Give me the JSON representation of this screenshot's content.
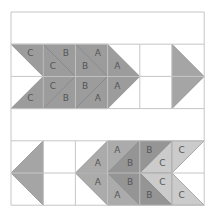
{
  "grid": {
    "x0": 11,
    "y0": 12,
    "cell": 32.2,
    "cols": 6,
    "rows": 6,
    "line_color": "#c6c6c6"
  },
  "colors": {
    "top": "#9c9c9c",
    "A": "#ababab",
    "B": "#959595",
    "C": "#cbcbcb",
    "single": "#a5a5a5"
  },
  "pieces": [
    {
      "id": "top-c1-up",
      "pts": [
        [
          0,
          1
        ],
        [
          1,
          1
        ],
        [
          1,
          2
        ]
      ],
      "fill": "top",
      "label": "C",
      "lx": 0.6,
      "ly": 1.3
    },
    {
      "id": "top-c1-dn",
      "pts": [
        [
          0,
          3
        ],
        [
          1,
          3
        ],
        [
          1,
          2
        ]
      ],
      "fill": "top",
      "label": "C",
      "lx": 0.6,
      "ly": 2.7
    },
    {
      "id": "top-c2-tr",
      "pts": [
        [
          1,
          1
        ],
        [
          2,
          1
        ],
        [
          2,
          2
        ]
      ],
      "fill": "top",
      "label": "B",
      "lx": 1.7,
      "ly": 1.3
    },
    {
      "id": "top-c2-mu",
      "pts": [
        [
          1,
          1
        ],
        [
          2,
          2
        ],
        [
          1,
          2
        ]
      ],
      "fill": "top",
      "label": "C",
      "lx": 1.3,
      "ly": 1.7
    },
    {
      "id": "top-c2-md",
      "pts": [
        [
          1,
          2
        ],
        [
          2,
          2
        ],
        [
          1,
          3
        ]
      ],
      "fill": "top",
      "label": "C",
      "lx": 1.3,
      "ly": 2.3
    },
    {
      "id": "top-c2-br",
      "pts": [
        [
          1,
          3
        ],
        [
          2,
          3
        ],
        [
          2,
          2
        ]
      ],
      "fill": "top",
      "label": "B",
      "lx": 1.7,
      "ly": 2.7
    },
    {
      "id": "top-c3-tr",
      "pts": [
        [
          2,
          1
        ],
        [
          3,
          1
        ],
        [
          3,
          2
        ]
      ],
      "fill": "top",
      "label": "A",
      "lx": 2.7,
      "ly": 1.3
    },
    {
      "id": "top-c3-mu",
      "pts": [
        [
          2,
          1
        ],
        [
          3,
          2
        ],
        [
          2,
          2
        ]
      ],
      "fill": "top",
      "label": "B",
      "lx": 2.3,
      "ly": 1.7
    },
    {
      "id": "top-c3-md",
      "pts": [
        [
          2,
          2
        ],
        [
          3,
          2
        ],
        [
          2,
          3
        ]
      ],
      "fill": "top",
      "label": "B",
      "lx": 2.3,
      "ly": 2.3
    },
    {
      "id": "top-c3-br",
      "pts": [
        [
          2,
          3
        ],
        [
          3,
          3
        ],
        [
          3,
          2
        ]
      ],
      "fill": "top",
      "label": "A",
      "lx": 2.7,
      "ly": 2.7
    },
    {
      "id": "top-c4-mu",
      "pts": [
        [
          3,
          1
        ],
        [
          4,
          2
        ],
        [
          3,
          2
        ]
      ],
      "fill": "top",
      "label": "A",
      "lx": 3.3,
      "ly": 1.7
    },
    {
      "id": "top-c4-md",
      "pts": [
        [
          3,
          2
        ],
        [
          4,
          2
        ],
        [
          3,
          3
        ]
      ],
      "fill": "top",
      "label": "A",
      "lx": 3.3,
      "ly": 2.3
    },
    {
      "id": "top-c6",
      "pts": [
        [
          5,
          1
        ],
        [
          6,
          2
        ],
        [
          5,
          3
        ]
      ],
      "fill": "single",
      "label": "",
      "lx": 0,
      "ly": 0
    },
    {
      "id": "bot-c1",
      "pts": [
        [
          1,
          4
        ],
        [
          0,
          5
        ],
        [
          1,
          6
        ]
      ],
      "fill": "single",
      "label": "",
      "lx": 0,
      "ly": 0
    },
    {
      "id": "bot-c3-mu",
      "pts": [
        [
          3,
          4
        ],
        [
          2,
          5
        ],
        [
          3,
          5
        ]
      ],
      "fill": "A",
      "label": "A",
      "lx": 2.7,
      "ly": 4.7
    },
    {
      "id": "bot-c3-md",
      "pts": [
        [
          3,
          5
        ],
        [
          2,
          5
        ],
        [
          3,
          6
        ]
      ],
      "fill": "A",
      "label": "A",
      "lx": 2.7,
      "ly": 5.3
    },
    {
      "id": "bot-c4-tl",
      "pts": [
        [
          3,
          4
        ],
        [
          4,
          4
        ],
        [
          3,
          5
        ]
      ],
      "fill": "A",
      "label": "A",
      "lx": 3.3,
      "ly": 4.3
    },
    {
      "id": "bot-c4-mu",
      "pts": [
        [
          4,
          4
        ],
        [
          4,
          5
        ],
        [
          3,
          5
        ]
      ],
      "fill": "B",
      "label": "B",
      "lx": 3.7,
      "ly": 4.7
    },
    {
      "id": "bot-c4-md",
      "pts": [
        [
          3,
          5
        ],
        [
          4,
          5
        ],
        [
          4,
          6
        ]
      ],
      "fill": "B",
      "label": "B",
      "lx": 3.7,
      "ly": 5.3
    },
    {
      "id": "bot-c4-bl",
      "pts": [
        [
          3,
          5
        ],
        [
          4,
          6
        ],
        [
          3,
          6
        ]
      ],
      "fill": "A",
      "label": "A",
      "lx": 3.3,
      "ly": 5.7
    },
    {
      "id": "bot-c5-tl",
      "pts": [
        [
          4,
          4
        ],
        [
          5,
          4
        ],
        [
          4,
          5
        ]
      ],
      "fill": "B",
      "label": "B",
      "lx": 4.3,
      "ly": 4.3
    },
    {
      "id": "bot-c5-mu",
      "pts": [
        [
          5,
          4
        ],
        [
          5,
          5
        ],
        [
          4,
          5
        ]
      ],
      "fill": "C",
      "label": "C",
      "lx": 4.7,
      "ly": 4.7
    },
    {
      "id": "bot-c5-md",
      "pts": [
        [
          4,
          5
        ],
        [
          5,
          5
        ],
        [
          5,
          6
        ]
      ],
      "fill": "C",
      "label": "C",
      "lx": 4.7,
      "ly": 5.3
    },
    {
      "id": "bot-c5-bl",
      "pts": [
        [
          4,
          5
        ],
        [
          5,
          6
        ],
        [
          4,
          6
        ]
      ],
      "fill": "B",
      "label": "B",
      "lx": 4.3,
      "ly": 5.7
    },
    {
      "id": "bot-c6-tl",
      "pts": [
        [
          5,
          4
        ],
        [
          6,
          4
        ],
        [
          5,
          5
        ]
      ],
      "fill": "C",
      "label": "C",
      "lx": 5.3,
      "ly": 4.3
    },
    {
      "id": "bot-c6-bl",
      "pts": [
        [
          5,
          5
        ],
        [
          6,
          6
        ],
        [
          5,
          6
        ]
      ],
      "fill": "C",
      "label": "C",
      "lx": 5.3,
      "ly": 5.7
    }
  ]
}
